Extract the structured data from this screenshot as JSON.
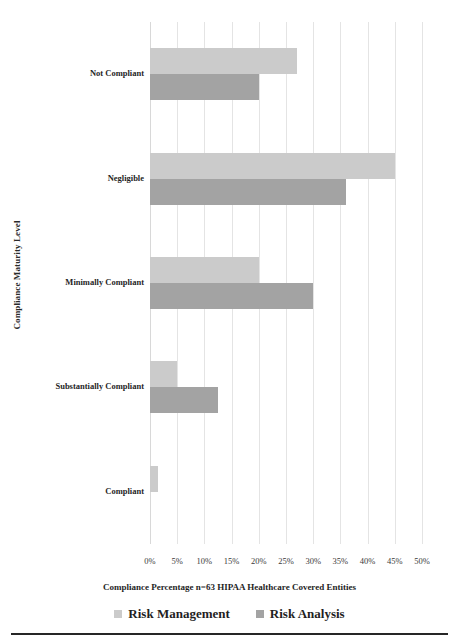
{
  "chart_data": {
    "type": "bar",
    "orientation": "horizontal",
    "title": "",
    "xlabel": "Compliance Percentage n=63 HIPAA Healthcare Covered Entities",
    "ylabel": "Compliance Maturity Level",
    "categories": [
      "Not Compliant",
      "Negligible",
      "Minimally Compliant",
      "Substantially Compliant",
      "Compliant"
    ],
    "series": [
      {
        "name": "Risk Management",
        "color": "#cbcbcb",
        "values": [
          27,
          45,
          20,
          5,
          1.5
        ]
      },
      {
        "name": "Risk Analysis",
        "color": "#a3a3a3",
        "values": [
          20,
          36,
          30,
          12.5,
          0
        ]
      }
    ],
    "xlim": [
      0,
      50
    ],
    "xticks": [
      0,
      5,
      10,
      15,
      20,
      25,
      30,
      35,
      40,
      45,
      50
    ],
    "xtick_labels": [
      "0%",
      "5%",
      "10%",
      "15%",
      "20%",
      "25%",
      "30%",
      "35%",
      "40%",
      "45%",
      "50%"
    ],
    "grid": true,
    "grid_axis": "x",
    "legend_position": "bottom",
    "value_suffix": "%"
  }
}
